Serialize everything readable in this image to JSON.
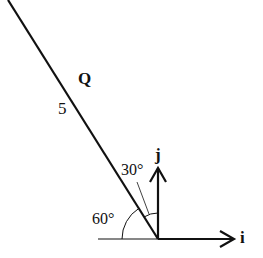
{
  "diagram": {
    "colors": {
      "stroke": "#111111",
      "background": "#ffffff"
    },
    "labels": {
      "point": "Q",
      "length": "5",
      "angle_from_j": "30°",
      "angle_from_horizontal": "60°",
      "unit_x": "i",
      "unit_y": "j"
    },
    "vectors": [
      {
        "name": "Q",
        "magnitude": 5,
        "direction_deg_from_negative_x": 60,
        "angle_to_j_deg": 30
      },
      {
        "name": "i",
        "type": "unit",
        "direction": "positive x"
      },
      {
        "name": "j",
        "type": "unit",
        "direction": "positive y"
      }
    ]
  }
}
